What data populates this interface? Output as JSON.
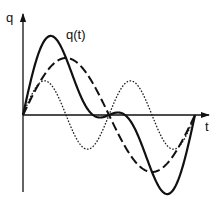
{
  "chart_data": {
    "type": "line",
    "title": "",
    "xlabel": "t",
    "ylabel": "q",
    "annotations": [
      {
        "text": "q(t)",
        "target": "sum (solid curve)"
      }
    ],
    "grid": false,
    "legend": null,
    "x_range": [
      0,
      1
    ],
    "x_unit": "fraction of one period T",
    "y_range": [
      -1.4,
      1.4
    ],
    "y_unit": "relative amplitude (fundamental = 1.0)",
    "series": [
      {
        "name": "fundamental",
        "style": "dashed",
        "formula": "1.0 * sin(2*pi*t)",
        "amplitude": 1.0,
        "harmonic": 1,
        "x": [
          0,
          0.25,
          0.5,
          0.75,
          1.0
        ],
        "y": [
          0,
          1.0,
          0,
          -1.0,
          0
        ]
      },
      {
        "name": "second harmonic",
        "style": "dotted",
        "formula": "0.6 * sin(4*pi*t)",
        "amplitude": 0.6,
        "harmonic": 2,
        "x": [
          0,
          0.125,
          0.25,
          0.375,
          0.5,
          0.625,
          0.75,
          0.875,
          1.0
        ],
        "y": [
          0,
          0.6,
          0,
          -0.6,
          0,
          0.6,
          0,
          -0.6,
          0
        ]
      },
      {
        "name": "q(t)",
        "style": "solid",
        "formula": "sin(2*pi*t) + 0.6*sin(4*pi*t)",
        "x": [
          0,
          0.162,
          0.25,
          0.5,
          0.75,
          0.838,
          1.0
        ],
        "y": [
          0,
          1.38,
          1.0,
          0,
          -1.0,
          -1.38,
          0
        ]
      }
    ]
  },
  "labels": {
    "y_axis": "q",
    "x_axis": "t",
    "curve": "q(t)"
  },
  "colors": {
    "ink": "#111111",
    "background": "#ffffff"
  },
  "layout": {
    "origin_x": 23,
    "origin_y": 115,
    "period_px": 172,
    "unit_px": 57
  }
}
